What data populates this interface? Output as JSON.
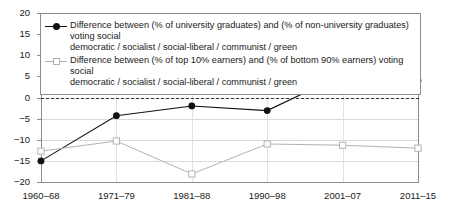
{
  "chart_data": {
    "type": "line",
    "title": "",
    "xlabel": "",
    "ylabel": "",
    "categories": [
      "1960–68",
      "1971–79",
      "1981–88",
      "1990–98",
      "2001–07",
      "2011–15"
    ],
    "yticks": [
      20,
      15,
      10,
      5,
      0,
      -5,
      -10,
      -15,
      -20
    ],
    "ytick_labels": [
      "20",
      "15",
      "10",
      "5",
      "0",
      "−5",
      "−10",
      "−15",
      "−20"
    ],
    "ylim": [
      -20,
      20
    ],
    "grid": true,
    "legend_position": "top-inside",
    "zero_reference_line": 0,
    "series": [
      {
        "name": "Difference between (% of university graduates) and (% of non-university graduates) voting social democratic / socialist / social-liberal / communist / green",
        "marker": "filled-circle",
        "color": "#111111",
        "values": [
          -15.0,
          -4.3,
          -2.0,
          -3.1,
          5.4,
          4.0
        ]
      },
      {
        "name": "Difference between (% of top 10% earners) and (% of bottom 90% earners) voting social democratic / socialist / social-liberal / communist / green",
        "marker": "open-square",
        "color": "#b3b3b3",
        "values": [
          -12.7,
          -10.3,
          -18.1,
          -11.0,
          -11.3,
          -12.0
        ]
      }
    ]
  },
  "legend": {
    "items": [
      {
        "line1": "Difference between (% of university graduates) and (% of non-university graduates) voting social",
        "line2": "democratic / socialist / social-liberal / communist / green",
        "marker_name": "filled-circle-marker"
      },
      {
        "line1": "Difference between (% of top 10% earners) and (% of bottom 90% earners) voting social",
        "line2": "democratic / socialist / social-liberal / communist / green",
        "marker_name": "open-square-marker"
      }
    ]
  },
  "colors": {
    "series1": "#111111",
    "series2": "#b3b3b3",
    "axis": "#8c8c8c",
    "grid": "#d9d9d9",
    "text": "#1a1a1a",
    "background": "#ffffff"
  }
}
